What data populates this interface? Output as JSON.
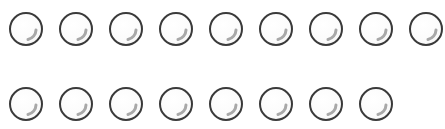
{
  "colors": {
    "outline": "#3a3a3a",
    "highlight": "#a8a8a8",
    "background": "#ffffff"
  },
  "grid": {
    "rows": [
      {
        "count": 9,
        "center_y": 28
      },
      {
        "count": 8,
        "center_y": 103
      }
    ],
    "start_center_x": 25,
    "spacing_x": 50,
    "diameter": 32
  },
  "bubbles": [
    {
      "row": 1,
      "index": 1,
      "icon": "bubble-icon"
    },
    {
      "row": 1,
      "index": 2,
      "icon": "bubble-icon"
    },
    {
      "row": 1,
      "index": 3,
      "icon": "bubble-icon"
    },
    {
      "row": 1,
      "index": 4,
      "icon": "bubble-icon"
    },
    {
      "row": 1,
      "index": 5,
      "icon": "bubble-icon"
    },
    {
      "row": 1,
      "index": 6,
      "icon": "bubble-icon"
    },
    {
      "row": 1,
      "index": 7,
      "icon": "bubble-icon"
    },
    {
      "row": 1,
      "index": 8,
      "icon": "bubble-icon"
    },
    {
      "row": 1,
      "index": 9,
      "icon": "bubble-icon"
    },
    {
      "row": 2,
      "index": 1,
      "icon": "bubble-icon"
    },
    {
      "row": 2,
      "index": 2,
      "icon": "bubble-icon"
    },
    {
      "row": 2,
      "index": 3,
      "icon": "bubble-icon"
    },
    {
      "row": 2,
      "index": 4,
      "icon": "bubble-icon"
    },
    {
      "row": 2,
      "index": 5,
      "icon": "bubble-icon"
    },
    {
      "row": 2,
      "index": 6,
      "icon": "bubble-icon"
    },
    {
      "row": 2,
      "index": 7,
      "icon": "bubble-icon"
    },
    {
      "row": 2,
      "index": 8,
      "icon": "bubble-icon"
    }
  ]
}
